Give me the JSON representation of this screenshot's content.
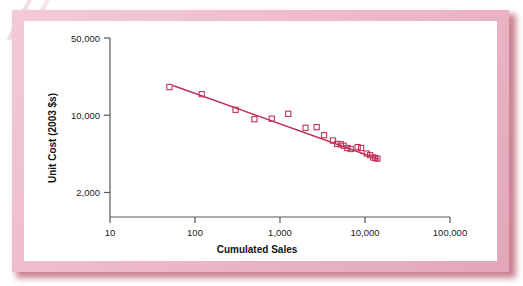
{
  "figure": {
    "background_color": "#ffffff",
    "frame_color": "#eebccc",
    "frame_shadow_color": "#b8566e",
    "plot_background": "#ffffff"
  },
  "chart_data": {
    "type": "scatter",
    "title": "",
    "subtitle": "",
    "xlabel": "Cumulated Sales",
    "ylabel": "Unit Cost (2003 $s)",
    "xscale": "log",
    "yscale": "log",
    "xlim": [
      10,
      100000
    ],
    "ylim": [
      1200,
      50000
    ],
    "grid": false,
    "legend": null,
    "marker_style": "open-square",
    "marker_color": "#c1335a",
    "line_color": "#bf2f56",
    "axis_color": "#58585a",
    "xticks": [
      10,
      100,
      1000,
      10000,
      100000
    ],
    "xtick_labels": [
      "10",
      "100",
      "1,000",
      "10,000",
      "100,000"
    ],
    "yticks": [
      2000,
      10000,
      50000
    ],
    "ytick_labels": [
      "2,000",
      "10,000",
      "50,000"
    ],
    "series": [
      {
        "name": "Unit cost observations",
        "type": "scatter",
        "points": [
          {
            "x": 50,
            "y": 18000
          },
          {
            "x": 120,
            "y": 15500
          },
          {
            "x": 300,
            "y": 11200
          },
          {
            "x": 500,
            "y": 9200
          },
          {
            "x": 800,
            "y": 9300
          },
          {
            "x": 1250,
            "y": 10300
          },
          {
            "x": 2000,
            "y": 7700
          },
          {
            "x": 2700,
            "y": 7800
          },
          {
            "x": 3300,
            "y": 6600
          },
          {
            "x": 4200,
            "y": 5900
          },
          {
            "x": 4700,
            "y": 5500
          },
          {
            "x": 5200,
            "y": 5450
          },
          {
            "x": 5600,
            "y": 5300
          },
          {
            "x": 6200,
            "y": 5050
          },
          {
            "x": 6800,
            "y": 4950
          },
          {
            "x": 8200,
            "y": 5150
          },
          {
            "x": 9000,
            "y": 5050
          },
          {
            "x": 10500,
            "y": 4500
          },
          {
            "x": 11500,
            "y": 4350
          },
          {
            "x": 12500,
            "y": 4150
          },
          {
            "x": 13200,
            "y": 4100
          },
          {
            "x": 14000,
            "y": 4050
          }
        ]
      },
      {
        "name": "Fitted experience curve",
        "type": "line",
        "points": [
          {
            "x": 55,
            "y": 18600
          },
          {
            "x": 14500,
            "y": 4000
          }
        ]
      }
    ]
  }
}
